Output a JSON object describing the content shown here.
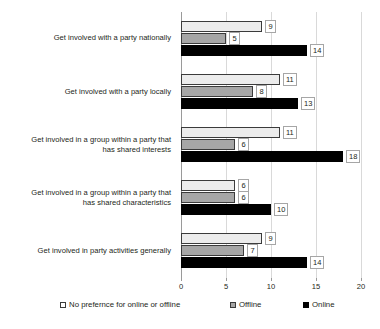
{
  "chart_data": {
    "type": "bar",
    "orientation": "horizontal",
    "title": "",
    "xlabel": "",
    "ylabel": "",
    "xlim": [
      0,
      20
    ],
    "xticks": [
      0,
      5,
      10,
      15,
      20
    ],
    "xtick_labels": [
      "0",
      "5",
      "10",
      "15",
      "20"
    ],
    "grid": true,
    "legend_position": "bottom",
    "categories": [
      "Get involved with a party nationally",
      "Get involved with a party locally",
      "Get involved in a group within a party that has shared interests",
      "Get involved in a group within a party that has shared characteristics",
      "Get involved in party activities generally"
    ],
    "category_lines": [
      [
        "Get involved with a party nationally"
      ],
      [
        "Get involved with a party locally"
      ],
      [
        "Get involved in a group within a party that",
        "has shared interests"
      ],
      [
        "Get involved in a group within a party that",
        "has shared characteristics"
      ],
      [
        "Get involved in party activities generally"
      ]
    ],
    "series": [
      {
        "name": "No prefernce for online or offline",
        "color": "#ececec",
        "values": [
          9,
          11,
          11,
          6,
          9
        ]
      },
      {
        "name": "Offline",
        "color": "#a6a6a6",
        "values": [
          5,
          8,
          6,
          6,
          7
        ]
      },
      {
        "name": "Online",
        "color": "#000000",
        "values": [
          14,
          13,
          18,
          10,
          14
        ]
      }
    ]
  },
  "legend": {
    "items": [
      {
        "label": "No prefernce for online or offline",
        "swatch": "white-square-icon"
      },
      {
        "label": "Offline",
        "swatch": "gray-square-icon"
      },
      {
        "label": "Online",
        "swatch": "black-square-icon"
      }
    ]
  }
}
